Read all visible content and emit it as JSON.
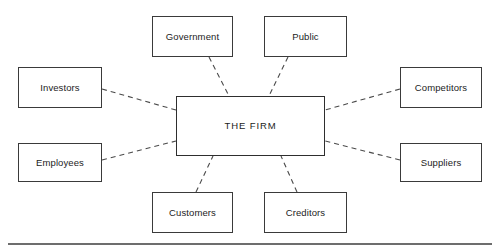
{
  "diagram": {
    "title": "THE FIRM",
    "type": "stakeholder-map",
    "center": {
      "id": "the-firm",
      "label": "THE FIRM",
      "x": 176,
      "y": 96,
      "w": 149,
      "h": 60
    },
    "nodes": [
      {
        "id": "government",
        "label": "Government",
        "x": 152,
        "y": 16,
        "w": 81,
        "h": 41
      },
      {
        "id": "public",
        "label": "Public",
        "x": 264,
        "y": 16,
        "w": 83,
        "h": 41
      },
      {
        "id": "investors",
        "label": "Investors",
        "x": 18,
        "y": 67,
        "w": 84,
        "h": 41
      },
      {
        "id": "competitors",
        "label": "Competitors",
        "x": 400,
        "y": 67,
        "w": 82,
        "h": 41
      },
      {
        "id": "employees",
        "label": "Employees",
        "x": 18,
        "y": 143,
        "w": 84,
        "h": 39
      },
      {
        "id": "suppliers",
        "label": "Suppliers",
        "x": 400,
        "y": 143,
        "w": 82,
        "h": 39
      },
      {
        "id": "customers",
        "label": "Customers",
        "x": 152,
        "y": 192,
        "w": 81,
        "h": 41
      },
      {
        "id": "creditors",
        "label": "Creditors",
        "x": 264,
        "y": 192,
        "w": 83,
        "h": 41
      }
    ],
    "edges": [
      {
        "id": "edge-government",
        "from": "government",
        "to": "the-firm",
        "x1": 209,
        "y1": 57,
        "x2": 229,
        "y2": 96,
        "style": "dashed"
      },
      {
        "id": "edge-public",
        "from": "public",
        "to": "the-firm",
        "x1": 288,
        "y1": 57,
        "x2": 269,
        "y2": 96,
        "style": "dashed"
      },
      {
        "id": "edge-investors",
        "from": "investors",
        "to": "the-firm",
        "x1": 102,
        "y1": 89,
        "x2": 176,
        "y2": 110,
        "style": "dashed"
      },
      {
        "id": "edge-competitors",
        "from": "competitors",
        "to": "the-firm",
        "x1": 400,
        "y1": 89,
        "x2": 325,
        "y2": 110,
        "style": "dashed"
      },
      {
        "id": "edge-employees",
        "from": "employees",
        "to": "the-firm",
        "x1": 102,
        "y1": 160,
        "x2": 176,
        "y2": 141,
        "style": "dashed"
      },
      {
        "id": "edge-suppliers",
        "from": "suppliers",
        "to": "the-firm",
        "x1": 400,
        "y1": 160,
        "x2": 325,
        "y2": 141,
        "style": "dashed"
      },
      {
        "id": "edge-customers",
        "from": "customers",
        "to": "the-firm",
        "x1": 196,
        "y1": 192,
        "x2": 213,
        "y2": 156,
        "style": "dashed"
      },
      {
        "id": "edge-creditors",
        "from": "creditors",
        "to": "the-firm",
        "x1": 297,
        "y1": 192,
        "x2": 281,
        "y2": 156,
        "style": "dashed"
      }
    ],
    "bottom_rule": {
      "x": 8,
      "y": 243,
      "w": 484,
      "h": 1.6
    },
    "colors": {
      "background": "#ffffff",
      "node_border": "#3a3a3a",
      "center_border": "#2e2e2e",
      "edge": "#4a4a4a",
      "text": "#1c1c1c",
      "rule": "#6d6d6d"
    }
  }
}
